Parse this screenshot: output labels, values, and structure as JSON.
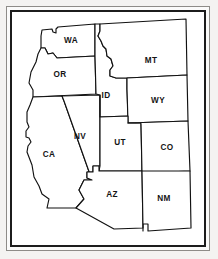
{
  "figure": {
    "background_color": "#f4f3f1",
    "paper_color": "#ffffff",
    "outline_color": "#111111",
    "label_color": "#141414",
    "frame": {
      "outer_line_color": "#8e8c88",
      "inner_line_color": "#1c1c1c"
    }
  },
  "map": {
    "type": "outline-map",
    "region": "Western United States",
    "state_count": 11,
    "states": [
      {
        "code": "WA",
        "label": "WA",
        "label_x": 71,
        "label_y": 41,
        "path": "M 41,36 L 42,30 L 52,29 L 53,32 L 56,33 L 56,29 L 58,27 L 95,24 L 95,56 L 57,58 L 53,53 L 48,54 L 45,48 L 41,48 Z"
      },
      {
        "code": "OR",
        "label": "OR",
        "label_x": 60,
        "label_y": 75,
        "path": "M 41,48 L 45,48 L 48,54 L 53,53 L 57,58 L 95,56 L 96,94 L 33,97 L 33,90 L 29,83 L 31,72 L 36,62 L 38,54 Z"
      },
      {
        "code": "CA",
        "label": "CA",
        "label_x": 49,
        "label_y": 155,
        "path": "M 33,97 L 62,96 L 64,101 L 92,180 L 84,180 L 79,190 L 84,199 L 76,208 L 47,208 L 49,199 L 42,194 L 39,186 L 34,177 L 32,165 L 27,152 L 28,146 L 31,142 L 29,138 L 26,137 L 26,131 L 29,127 L 27,122 L 27,112 L 30,105 Z"
      },
      {
        "code": "NV",
        "label": "NV",
        "label_x": 80,
        "label_y": 137,
        "path": "M 62,96 L 100,95 L 100,166 L 93,166 L 93,172 L 87,172 L 87,178 L 92,180 L 64,101 Z"
      },
      {
        "code": "ID",
        "label": "ID",
        "label_x": 106,
        "label_y": 96,
        "path": "M 95,24 L 100,24 L 100,31 L 98,36 L 101,41 L 103,46 L 106,49 L 107,56 L 111,59 L 113,66 L 110,70 L 110,76 L 116,78 L 127,78 L 127,89 L 128,116 L 100,117 L 100,95 L 96,94 L 95,56 Z"
      },
      {
        "code": "MT",
        "label": "MT",
        "label_x": 151,
        "label_y": 61,
        "path": "M 100,24 L 186,19 L 187,75 L 127,78 L 116,78 L 110,76 L 110,70 L 113,66 L 111,59 L 107,56 L 106,49 L 103,46 L 101,41 L 98,36 L 100,31 Z"
      },
      {
        "code": "WY",
        "label": "WY",
        "label_x": 158,
        "label_y": 101,
        "path": "M 127,78 L 187,75 L 188,121 L 128,123 L 127,89 Z"
      },
      {
        "code": "UT",
        "label": "UT",
        "label_x": 120,
        "label_y": 143,
        "path": "M 100,117 L 128,116 L 128,123 L 141,123 L 142,171 L 99,171 L 100,166 L 100,95 Z"
      },
      {
        "code": "CO",
        "label": "CO",
        "label_x": 167,
        "label_y": 148,
        "path": "M 128,123 L 188,121 L 190,171 L 142,173 L 141,123 Z"
      },
      {
        "code": "AZ",
        "label": "AZ",
        "label_x": 112,
        "label_y": 195,
        "path": "M 99,171 L 142,171 L 143,228 L 114,229 L 76,208 L 84,199 L 79,190 L 84,180 L 92,180 L 87,178 L 87,172 L 93,172 L 93,166 L 99,166 Z"
      },
      {
        "code": "NM",
        "label": "NM",
        "label_x": 164,
        "label_y": 199,
        "path": "M 142,171 L 190,171 L 191,228 L 148,231 L 148,224 L 143,224 L 143,231 L 143,228 Z"
      }
    ]
  }
}
